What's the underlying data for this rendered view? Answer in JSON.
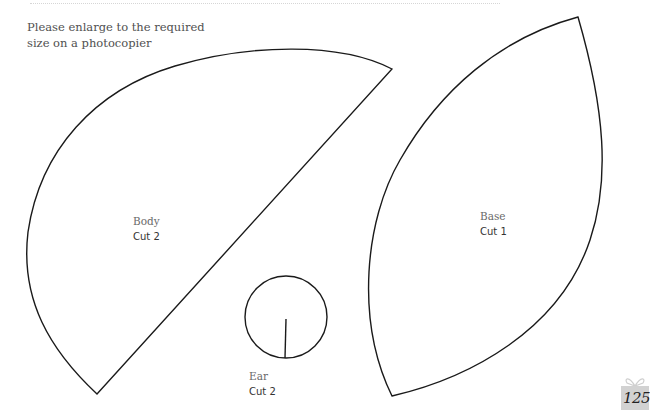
{
  "instructions": {
    "line1": "Please enlarge to the required",
    "line2": "size on a photocopier"
  },
  "pieces": [
    {
      "name": "Body",
      "quantity": "Cut 2"
    },
    {
      "name": "Base",
      "quantity": "Cut 1"
    },
    {
      "name": "Ear",
      "quantity": "Cut 2"
    }
  ],
  "page": {
    "number": "125"
  },
  "colors": {
    "outline": "#1a1a1a",
    "badge": "#d2d2d2"
  }
}
